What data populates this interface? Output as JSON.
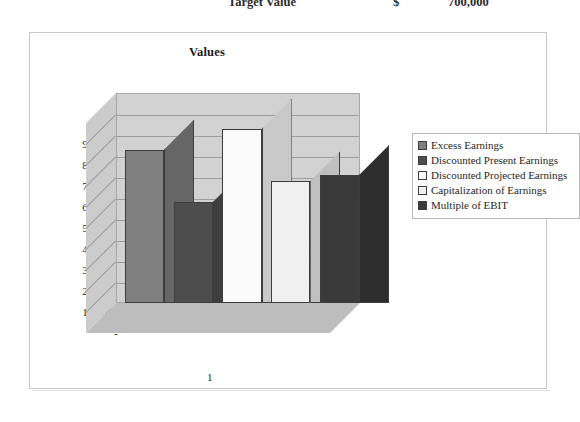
{
  "top_row": {
    "label": "Target Value",
    "currency_symbol": "$",
    "amount": "700,000"
  },
  "chart": {
    "title": "Values",
    "x_category_label": "1",
    "zero_label": "-"
  },
  "legend": {
    "items": [
      {
        "label": "Excess Earnings",
        "color": "#808080"
      },
      {
        "label": "Discounted Present Earnings",
        "color": "#4d4d4d"
      },
      {
        "label": "Discounted Projected Earnings",
        "color": "#fbfbfb"
      },
      {
        "label": "Capitalization of Earnings",
        "color": "#f0f0f0"
      },
      {
        "label": "Multiple of EBIT",
        "color": "#3a3a3a"
      }
    ]
  },
  "chart_data": {
    "type": "bar",
    "title": "Values",
    "xlabel": "",
    "ylabel": "",
    "categories": [
      "1"
    ],
    "ylim": [
      0,
      1000000
    ],
    "yticks": [
      0,
      100000,
      200000,
      300000,
      400000,
      500000,
      600000,
      700000,
      800000,
      900000
    ],
    "ytick_labels": [
      "-",
      "100,000",
      "200,000",
      "300,000",
      "400,000",
      "500,000",
      "600,000",
      "700,000",
      "800,000",
      "900,000"
    ],
    "grid": true,
    "legend_position": "right",
    "three_d": true,
    "series": [
      {
        "name": "Excess Earnings",
        "values": [
          730000
        ],
        "color": "#808080"
      },
      {
        "name": "Discounted Present Earnings",
        "values": [
          480000
        ],
        "color": "#4d4d4d"
      },
      {
        "name": "Discounted Projected Earnings",
        "values": [
          830000
        ],
        "color": "#fbfbfb"
      },
      {
        "name": "Capitalization of Earnings",
        "values": [
          580000
        ],
        "color": "#f0f0f0"
      },
      {
        "name": "Multiple of EBIT",
        "values": [
          610000
        ],
        "color": "#3a3a3a"
      }
    ]
  }
}
